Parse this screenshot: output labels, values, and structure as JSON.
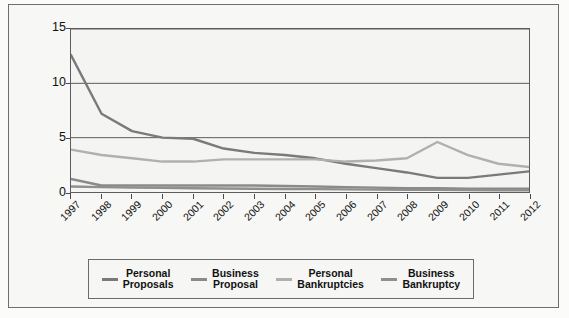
{
  "chart_data": {
    "type": "line",
    "title": "",
    "xlabel": "",
    "ylabel": "Per 1,000 Population/Businesses",
    "ylim": [
      0,
      15
    ],
    "yticks": [
      0,
      5,
      10,
      15
    ],
    "grid": true,
    "legend_position": "bottom",
    "categories": [
      "1997",
      "1998",
      "1999",
      "2000",
      "2001",
      "2002",
      "2003",
      "2004",
      "2005",
      "2006",
      "2007",
      "2008",
      "2009",
      "2010",
      "2011",
      "2012"
    ],
    "series": [
      {
        "name": "Personal Proposals",
        "color": "#7a7a7a",
        "values": [
          12.6,
          7.2,
          5.6,
          5.0,
          4.9,
          4.0,
          3.6,
          3.4,
          3.1,
          2.6,
          2.2,
          1.8,
          1.3,
          1.3,
          1.6,
          1.9
        ]
      },
      {
        "name": "Business Proposal",
        "color": "#8a8a8a",
        "values": [
          1.2,
          0.6,
          0.6,
          0.6,
          0.6,
          0.6,
          0.6,
          0.55,
          0.5,
          0.45,
          0.4,
          0.35,
          0.35,
          0.3,
          0.3,
          0.3
        ]
      },
      {
        "name": "Personal Bankruptcies",
        "color": "#b0b0b0",
        "values": [
          3.9,
          3.4,
          3.1,
          2.8,
          2.8,
          3.0,
          3.0,
          3.0,
          3.0,
          2.8,
          2.9,
          3.1,
          4.6,
          3.4,
          2.6,
          2.3
        ]
      },
      {
        "name": "Business Bankruptcy",
        "color": "#8f8f8f",
        "values": [
          0.5,
          0.45,
          0.4,
          0.38,
          0.35,
          0.32,
          0.3,
          0.28,
          0.26,
          0.24,
          0.22,
          0.2,
          0.2,
          0.18,
          0.16,
          0.15
        ]
      }
    ]
  },
  "axis": {
    "y_title": "Per 1,000 Population/Businesses",
    "y_tick_labels": [
      "15",
      "10",
      "5",
      "0"
    ],
    "x_tick_labels": [
      "1997",
      "1998",
      "1999",
      "2000",
      "2001",
      "2002",
      "2003",
      "2004",
      "2005",
      "2006",
      "2007",
      "2008",
      "2009",
      "2010",
      "2011",
      "2012"
    ]
  },
  "legend": {
    "items": [
      {
        "label": "Personal\nProposals",
        "color": "#7a7a7a"
      },
      {
        "label": "Business\nProposal",
        "color": "#8a8a8a"
      },
      {
        "label": "Personal\nBankruptcies",
        "color": "#b0b0b0"
      },
      {
        "label": "Business\nBankruptcy",
        "color": "#8f8f8f"
      }
    ]
  }
}
